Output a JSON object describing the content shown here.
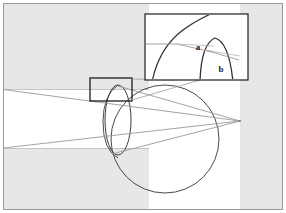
{
  "figure": {
    "canvas": {
      "width": 286,
      "height": 213
    },
    "colors": {
      "frame_border": "#9a9a9a",
      "background": "#ffffff",
      "shaded_region": "#e6e6e6",
      "shaded_region_edge": "#c9c9c9",
      "outline_dark": "#3a3a3a",
      "outline_mid": "#555555",
      "ray_line": "#8d8d8d",
      "label_color": "#1a1a1a",
      "inset_border": "#3a3a3a",
      "callout_border": "#1a1a1a"
    },
    "frame": {
      "x": 3,
      "y": 3,
      "width": 280,
      "height": 207
    },
    "shaded_regions": [
      {
        "name": "upper-shaded-band",
        "x": 3,
        "y": 3,
        "width": 146,
        "height": 87
      },
      {
        "name": "lower-shaded-band",
        "x": 3,
        "y": 148,
        "width": 146,
        "height": 62
      },
      {
        "name": "right-shaded-band",
        "x": 240,
        "y": 3,
        "width": 43,
        "height": 207
      }
    ],
    "sphere": {
      "name": "main-sphere",
      "cx": 165,
      "cy": 139,
      "r": 54
    },
    "lens_ellipse": {
      "name": "lens-ellipse",
      "cx": 118,
      "cy": 120,
      "rx": 13,
      "ry": 35
    },
    "vertex_point": {
      "x": 240,
      "y": 121
    },
    "ray_lines": [
      {
        "name": "upper-ray",
        "x1": 4,
        "y1": 89,
        "x2": 240,
        "y2": 121
      },
      {
        "name": "lower-ray",
        "x1": 4,
        "y1": 148,
        "x2": 240,
        "y2": 121
      },
      {
        "name": "upper-ray-inset-tail",
        "x1": 118,
        "y1": 90,
        "x2": 240,
        "y2": 121
      }
    ],
    "detail_rect": {
      "name": "detail-region-rect",
      "x": 90,
      "y": 78,
      "width": 42,
      "height": 23
    },
    "inset_box": {
      "name": "magnified-inset-box",
      "x": 145,
      "y": 14,
      "width": 103,
      "height": 66
    },
    "callout_lines": [
      {
        "name": "callout-upper",
        "x1": 132,
        "y1": 78,
        "x2": 176,
        "y2": 80
      },
      {
        "name": "callout-lower",
        "x1": 132,
        "y1": 101,
        "x2": 200,
        "y2": 80
      }
    ],
    "labels": [
      {
        "name": "label-a",
        "text": "a",
        "x": 200,
        "y": 48
      },
      {
        "name": "label-b",
        "text": "b",
        "x": 222,
        "y": 70
      }
    ],
    "inset_contents": {
      "sphere_arc_name": "inset-sphere-arc",
      "lens_arc_name": "inset-lens-arc",
      "horizontal_ray_name": "inset-horizontal-ray",
      "refracted_ray_a_name": "inset-refracted-ray-a",
      "refracted_ray_b_name": "inset-refracted-ray-b"
    }
  }
}
